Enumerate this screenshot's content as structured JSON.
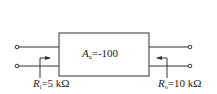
{
  "diagram": {
    "type": "two-port amplifier block",
    "block": {
      "symbol": "A",
      "subscript": "u",
      "relation": "=",
      "value": "-100"
    },
    "input_resistance": {
      "symbol": "R",
      "subscript": "i",
      "value": "=5 kΩ"
    },
    "output_resistance": {
      "symbol": "R",
      "subscript": "o",
      "value": "=10 kΩ"
    },
    "colors": {
      "line": "#333333",
      "background": "#ffffff"
    }
  }
}
